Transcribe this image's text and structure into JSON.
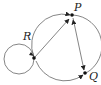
{
  "diagram": {
    "type": "directed-graph",
    "nodes": [
      {
        "id": "P",
        "label": "P"
      },
      {
        "id": "Q",
        "label": "Q"
      },
      {
        "id": "R",
        "label": "R"
      }
    ],
    "edges": [
      {
        "from": "R",
        "to": "R",
        "kind": "self-loop"
      },
      {
        "from": "R",
        "to": "P",
        "kind": "straight"
      },
      {
        "from": "R",
        "to": "P",
        "kind": "arc"
      },
      {
        "from": "P",
        "to": "Q",
        "kind": "straight"
      },
      {
        "from": "Q",
        "to": "P",
        "kind": "arc"
      },
      {
        "from": "R",
        "to": "Q",
        "kind": "arc"
      }
    ],
    "colors": {
      "line": "#555555",
      "node": "#111111",
      "background": "#ffffff"
    }
  }
}
